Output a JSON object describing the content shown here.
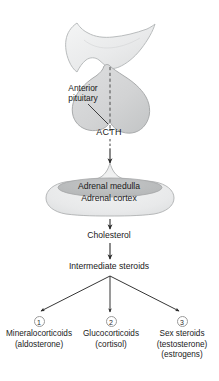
{
  "diagram": {
    "type": "flow-diagram",
    "colors": {
      "brain_fill": "#eceded",
      "brain_stroke": "#b9bcbd",
      "pituitary_fill": "#d6d7d8",
      "pituitary_stroke": "#a9abac",
      "adrenal_cortex_fill": "#eaebec",
      "adrenal_cortex_stroke": "#b6b8b9",
      "adrenal_medulla_fill": "#b9bbbc",
      "adrenal_medulla_stroke": "#a4a6a7",
      "arrow": "#2b2b2b",
      "badge_border": "#9a9a9a",
      "text": "#1a1a1a",
      "background": "#ffffff"
    },
    "anatomy": {
      "anterior_pituitary_label": "Anterior pituitary",
      "adrenal_medulla_label": "Adrenal medulla",
      "adrenal_cortex_label": "Adrenal cortex"
    },
    "pathway": {
      "hormone_label": "ACTH",
      "precursor_label": "Cholesterol",
      "intermediate_label": "Intermediate steroids"
    },
    "outcomes": [
      {
        "number": "1",
        "name": "Mineralocorticoids",
        "example": "(aldosterone)",
        "extra": ""
      },
      {
        "number": "2",
        "name": "Glucocorticoids",
        "example": "(cortisol)",
        "extra": ""
      },
      {
        "number": "3",
        "name": "Sex steroids",
        "example": "(testosterone)",
        "extra": "(estrogens)"
      }
    ]
  }
}
